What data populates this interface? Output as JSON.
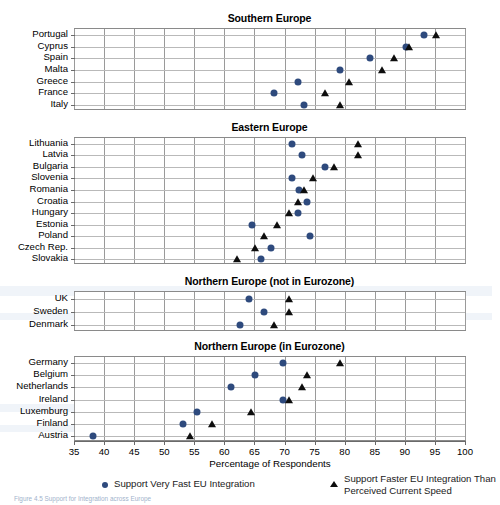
{
  "figure": {
    "xaxis_title": "Percentage of Respondents",
    "xticks": [
      35,
      40,
      45,
      50,
      55,
      60,
      65,
      70,
      75,
      80,
      85,
      90,
      95,
      100
    ],
    "xlim": [
      35,
      100
    ],
    "caption": "Figure 4.5  Support for Integration across Europe"
  },
  "legend": {
    "dot_label": "Support Very Fast EU Integration",
    "tri_label": "Support Faster EU Integration Than Perceived Current Speed",
    "tri_label_line1": "Support Faster EU Integration Than",
    "tri_label_line2": "Perceived Current Speed",
    "dot_icon": "filled-circle-marker",
    "tri_icon": "filled-triangle-marker",
    "dot_color": "#2e4a7d",
    "tri_color": "#0d0d0d"
  },
  "chart_data": {
    "type": "scatter",
    "title": "Support for Integration across Europe",
    "xlabel": "Percentage of Respondents",
    "ylabel": "",
    "xlim": [
      35,
      100
    ],
    "grid": true,
    "legend_position": "bottom",
    "series_names": [
      "Support Very Fast EU Integration",
      "Support Faster EU Integration Than Perceived Current Speed"
    ],
    "panels": [
      {
        "title": "Southern Europe",
        "categories": [
          "Portugal",
          "Cyprus",
          "Spain",
          "Malta",
          "Greece",
          "France",
          "Italy"
        ],
        "series": [
          {
            "name": "Support Very Fast EU Integration",
            "marker": "circle",
            "values": [
              93.0,
              90.0,
              84.0,
              79.0,
              72.0,
              68.0,
              73.0
            ]
          },
          {
            "name": "Support Faster EU Integration Than Perceived Current Speed",
            "marker": "triangle",
            "values": [
              95.0,
              90.5,
              88.0,
              86.0,
              80.5,
              76.5,
              79.0
            ]
          }
        ]
      },
      {
        "title": "Eastern Europe",
        "categories": [
          "Lithuania",
          "Latvia",
          "Bulgaria",
          "Slovenia",
          "Romania",
          "Croatia",
          "Hungary",
          "Estonia",
          "Poland",
          "Czech Rep.",
          "Slovakia"
        ],
        "series": [
          {
            "name": "Support Very Fast EU Integration",
            "marker": "circle",
            "values": [
              71.0,
              72.8,
              76.5,
              71.0,
              72.2,
              73.6,
              72.1,
              64.5,
              74.0,
              67.5,
              66.0
            ]
          },
          {
            "name": "Support Faster EU Integration Than Perceived Current Speed",
            "marker": "triangle",
            "values": [
              82.0,
              82.0,
              78.0,
              74.5,
              73.0,
              72.0,
              70.5,
              68.5,
              66.5,
              65.0,
              62.0
            ]
          }
        ]
      },
      {
        "title": "Northern Europe (not in Eurozone)",
        "categories": [
          "UK",
          "Sweden",
          "Denmark"
        ],
        "series": [
          {
            "name": "Support Very Fast EU Integration",
            "marker": "circle",
            "values": [
              64.0,
              66.5,
              62.5
            ]
          },
          {
            "name": "Support Faster EU Integration Than Perceived Current Speed",
            "marker": "triangle",
            "values": [
              70.6,
              70.6,
              68.0
            ]
          }
        ]
      },
      {
        "title": "Northern Europe (in Eurozone)",
        "categories": [
          "Germany",
          "Belgium",
          "Netherlands",
          "Ireland",
          "Luxemburg",
          "Finland",
          "Austria"
        ],
        "series": [
          {
            "name": "Support Very Fast EU Integration",
            "marker": "circle",
            "values": [
              69.5,
              65.0,
              61.0,
              69.5,
              55.3,
              52.9,
              38.0
            ]
          },
          {
            "name": "Support Faster EU Integration Than Perceived Current Speed",
            "marker": "triangle",
            "values": [
              79.0,
              73.5,
              72.8,
              70.5,
              64.2,
              57.7,
              54.2
            ]
          }
        ]
      }
    ]
  }
}
